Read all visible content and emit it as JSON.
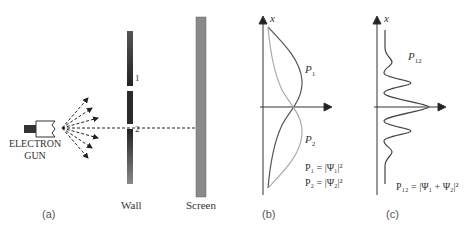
{
  "panel_a": {
    "gun_label_line1": "ELECTRON",
    "gun_label_line2": "GUN",
    "slit1_label": "1",
    "slit2_label": "2",
    "wall_label": "Wall",
    "screen_label": "Screen",
    "caption": "(a)"
  },
  "panel_b": {
    "axis_label": "x",
    "curve1_label": "P",
    "curve1_sub": "1",
    "curve2_label": "P",
    "curve2_sub": "2",
    "eq1": "P₁ = |Ψ₁|²",
    "eq2": "P₂ = |Ψ₂|²",
    "caption": "(b)"
  },
  "panel_c": {
    "axis_label": "x",
    "curve_label": "P",
    "curve_sub": "12",
    "eq": "P₁₂ = |Ψ₁ + Ψ₂|²",
    "caption": "(c)"
  },
  "colors": {
    "wall": "#3a3a3a",
    "screen": "#8a8a8a",
    "p1_curve": "#555555",
    "p2_curve": "#aaaaaa",
    "axis": "#333333"
  }
}
